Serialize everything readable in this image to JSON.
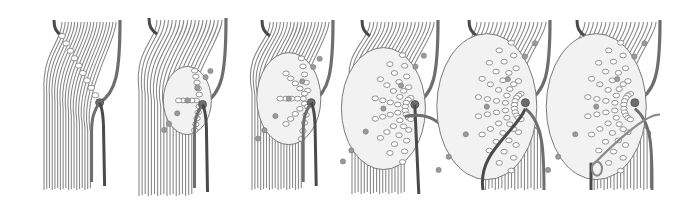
{
  "illustration": {
    "title": "",
    "description": "Six sequential stages of a knotted cord fan (macramé) technique",
    "colors": {
      "background": "#ffffff",
      "cord_light": "#8a8a8a",
      "cord_light_fill": "#ffffff",
      "cord_dark": "#4a4a4a",
      "cord_mid": "#6e6e6e",
      "knot_fill": "#f2f2f2",
      "knot_stroke": "#7a7a7a",
      "knot_accent": "#9a9a9a"
    },
    "figures": [
      {
        "id": 1,
        "label": "",
        "x0": 42,
        "x1": 122,
        "top": 22,
        "bottom": 190,
        "knotRows": 1,
        "bulge": 0,
        "stage": "single-diagonal-row"
      },
      {
        "id": 2,
        "label": "",
        "x0": 137,
        "x1": 228,
        "top": 20,
        "bottom": 196,
        "knotRows": 3,
        "bulge": 8,
        "stage": "three-rows"
      },
      {
        "id": 3,
        "label": "",
        "x0": 250,
        "x1": 335,
        "top": 22,
        "bottom": 190,
        "knotRows": 5,
        "bulge": 16,
        "stage": "five-rows"
      },
      {
        "id": 4,
        "label": "",
        "x0": 350,
        "x1": 440,
        "top": 22,
        "bottom": 194,
        "knotRows": 8,
        "bulge": 26,
        "stage": "fan-with-crossing-cord"
      },
      {
        "id": 5,
        "label": "",
        "x0": 457,
        "x1": 552,
        "top": 22,
        "bottom": 190,
        "knotRows": 10,
        "bulge": 34,
        "stage": "full-fan-crossed"
      },
      {
        "id": 6,
        "label": "",
        "x0": 565,
        "x1": 662,
        "top": 22,
        "bottom": 190,
        "knotRows": 10,
        "bulge": 34,
        "stage": "full-fan-looped-finish"
      }
    ]
  }
}
